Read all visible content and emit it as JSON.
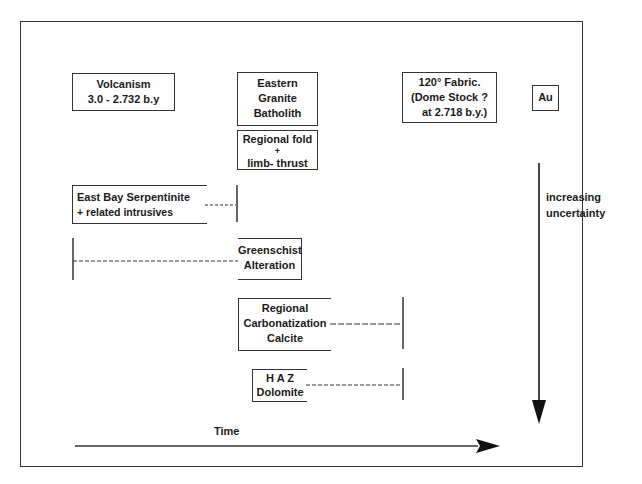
{
  "diagram": {
    "type": "timeline-paragenesis",
    "colors": {
      "line": "#333333",
      "text": "#1a1a1a",
      "background": "#ffffff"
    },
    "boxes": {
      "volcanism": {
        "lines": [
          "Volcanism",
          "3.0 - 2.732 b.y"
        ]
      },
      "granite": {
        "lines": [
          "Eastern",
          "Granite",
          "Batholith"
        ]
      },
      "fold": {
        "lines": [
          "Regional fold",
          "+",
          "limb- thrust"
        ]
      },
      "fabric": {
        "lines": [
          "120° Fabric.",
          "(Dome Stock ?",
          "at 2.718 b.y.)"
        ]
      },
      "au": {
        "lines": [
          "Au"
        ]
      },
      "serpentinite": {
        "lines": [
          "East Bay Serpentinite",
          "+ related intrusives"
        ]
      },
      "greenschist": {
        "lines": [
          "Greenschist",
          "Alteration"
        ]
      },
      "carbonatization": {
        "lines": [
          "Regional",
          "Carbonatization",
          "Calcite"
        ]
      },
      "haz": {
        "lines": [
          "H A Z",
          "Dolomite"
        ]
      }
    },
    "labels": {
      "uncertainty": [
        "increasing",
        "uncertainty"
      ],
      "time": "Time"
    },
    "arrows": {
      "time_axis": {
        "direction": "right",
        "label": "Time"
      },
      "uncertainty_axis": {
        "direction": "down",
        "label": "increasing uncertainty"
      }
    }
  }
}
